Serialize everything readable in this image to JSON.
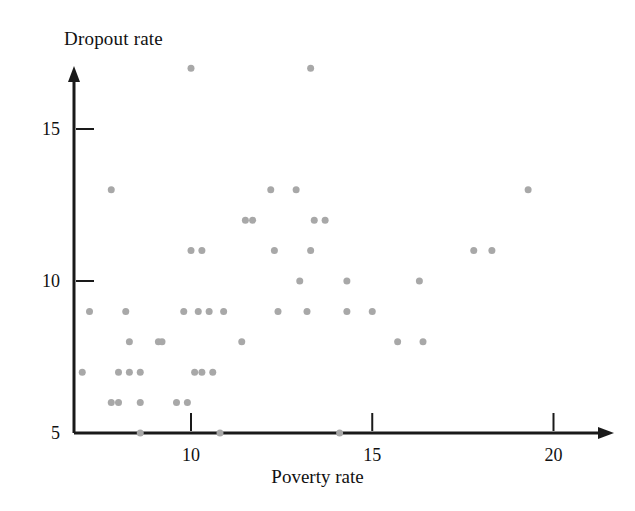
{
  "chart_data": {
    "type": "scatter",
    "title": "",
    "xlabel": "Poverty rate",
    "ylabel": "Dropout rate",
    "xlim": [
      6.8,
      21.5
    ],
    "ylim": [
      5,
      17.6
    ],
    "xticks": [
      10,
      15,
      20
    ],
    "xtick_labels": [
      "10",
      "15",
      "20"
    ],
    "yticks": [
      5,
      10,
      15
    ],
    "ytick_labels": [
      "5",
      "10",
      "15"
    ],
    "grid": false,
    "legend": null,
    "marker_color": "#a8a8a8",
    "marker_size": 7,
    "axis_color": "#1a1a1a",
    "background": "#ffffff",
    "points": [
      {
        "x": 10.0,
        "y": 17.0
      },
      {
        "x": 13.3,
        "y": 17.0
      },
      {
        "x": 7.8,
        "y": 13.0
      },
      {
        "x": 12.2,
        "y": 13.0
      },
      {
        "x": 12.9,
        "y": 13.0
      },
      {
        "x": 19.3,
        "y": 13.0
      },
      {
        "x": 11.5,
        "y": 12.0
      },
      {
        "x": 11.7,
        "y": 12.0
      },
      {
        "x": 13.4,
        "y": 12.0
      },
      {
        "x": 13.7,
        "y": 12.0
      },
      {
        "x": 10.0,
        "y": 11.0
      },
      {
        "x": 10.3,
        "y": 11.0
      },
      {
        "x": 12.3,
        "y": 11.0
      },
      {
        "x": 13.3,
        "y": 11.0
      },
      {
        "x": 17.8,
        "y": 11.0
      },
      {
        "x": 18.3,
        "y": 11.0
      },
      {
        "x": 13.0,
        "y": 10.0
      },
      {
        "x": 14.3,
        "y": 10.0
      },
      {
        "x": 16.3,
        "y": 10.0
      },
      {
        "x": 7.2,
        "y": 9.0
      },
      {
        "x": 8.2,
        "y": 9.0
      },
      {
        "x": 9.8,
        "y": 9.0
      },
      {
        "x": 10.2,
        "y": 9.0
      },
      {
        "x": 10.5,
        "y": 9.0
      },
      {
        "x": 10.9,
        "y": 9.0
      },
      {
        "x": 12.4,
        "y": 9.0
      },
      {
        "x": 13.2,
        "y": 9.0
      },
      {
        "x": 14.3,
        "y": 9.0
      },
      {
        "x": 15.0,
        "y": 9.0
      },
      {
        "x": 8.3,
        "y": 8.0
      },
      {
        "x": 9.1,
        "y": 8.0
      },
      {
        "x": 9.2,
        "y": 8.0
      },
      {
        "x": 11.4,
        "y": 8.0
      },
      {
        "x": 15.7,
        "y": 8.0
      },
      {
        "x": 16.4,
        "y": 8.0
      },
      {
        "x": 7.0,
        "y": 7.0
      },
      {
        "x": 8.0,
        "y": 7.0
      },
      {
        "x": 8.3,
        "y": 7.0
      },
      {
        "x": 8.6,
        "y": 7.0
      },
      {
        "x": 10.1,
        "y": 7.0
      },
      {
        "x": 10.3,
        "y": 7.0
      },
      {
        "x": 10.6,
        "y": 7.0
      },
      {
        "x": 7.8,
        "y": 6.0
      },
      {
        "x": 8.0,
        "y": 6.0
      },
      {
        "x": 8.6,
        "y": 6.0
      },
      {
        "x": 9.6,
        "y": 6.0
      },
      {
        "x": 9.9,
        "y": 6.0
      },
      {
        "x": 8.6,
        "y": 5.0
      },
      {
        "x": 10.8,
        "y": 5.0
      },
      {
        "x": 14.1,
        "y": 5.0
      }
    ]
  }
}
